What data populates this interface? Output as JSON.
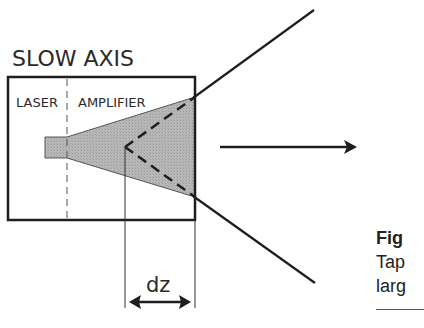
{
  "diagram": {
    "title": "SLOW AXIS",
    "sections": [
      {
        "label": "LASER"
      },
      {
        "label": "AMPLIFIER"
      }
    ],
    "dimension_label": "dz",
    "colors": {
      "line": "#1e1e1e",
      "gain_region_fill": "#b4b4b4"
    }
  },
  "caption": {
    "line1": "Fig",
    "line2": "Tap",
    "line3": "larg"
  }
}
